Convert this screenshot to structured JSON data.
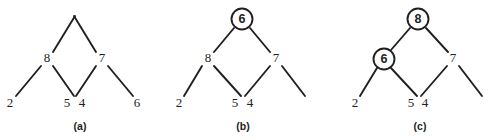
{
  "figure": {
    "width": 496,
    "height": 140,
    "background": "#ffffff",
    "ink_color": "#231f20"
  },
  "panels": [
    {
      "id": "a",
      "caption": "(a)",
      "caption_x": 80,
      "caption_y": 127,
      "nodes": [
        {
          "label": "8",
          "x": 47,
          "y": 59,
          "circled": false
        },
        {
          "label": "7",
          "x": 102,
          "y": 59,
          "circled": false
        },
        {
          "label": "2",
          "x": 10,
          "y": 104,
          "circled": false
        },
        {
          "label": "5",
          "x": 67,
          "y": 104,
          "circled": false
        },
        {
          "label": "4",
          "x": 82,
          "y": 104,
          "circled": false
        },
        {
          "label": "6",
          "x": 137,
          "y": 104,
          "circled": false
        }
      ],
      "edges": [
        {
          "x1": 53,
          "y1": 52,
          "x2": 75,
          "y2": 16
        },
        {
          "x1": 96,
          "y1": 52,
          "x2": 74,
          "y2": 16
        },
        {
          "x1": 41,
          "y1": 66,
          "x2": 16,
          "y2": 96
        },
        {
          "x1": 53,
          "y1": 66,
          "x2": 74,
          "y2": 96
        },
        {
          "x1": 96,
          "y1": 66,
          "x2": 76,
          "y2": 96
        },
        {
          "x1": 108,
          "y1": 66,
          "x2": 133,
          "y2": 96
        }
      ]
    },
    {
      "id": "b",
      "caption": "(b)",
      "caption_x": 243,
      "caption_y": 127,
      "nodes": [
        {
          "label": "6",
          "x": 242,
          "y": 19,
          "circled": true
        },
        {
          "label": "8",
          "x": 208,
          "y": 59,
          "circled": false
        },
        {
          "label": "7",
          "x": 276,
          "y": 59,
          "circled": false
        },
        {
          "label": "2",
          "x": 179,
          "y": 104,
          "circled": false
        },
        {
          "label": "5",
          "x": 235,
          "y": 104,
          "circled": false
        },
        {
          "label": "4",
          "x": 250,
          "y": 104,
          "circled": false
        }
      ],
      "edges": [
        {
          "x1": 234,
          "y1": 28,
          "x2": 214,
          "y2": 52
        },
        {
          "x1": 250,
          "y1": 28,
          "x2": 270,
          "y2": 52
        },
        {
          "x1": 202,
          "y1": 66,
          "x2": 184,
          "y2": 96
        },
        {
          "x1": 214,
          "y1": 66,
          "x2": 241,
          "y2": 96
        },
        {
          "x1": 270,
          "y1": 66,
          "x2": 245,
          "y2": 96
        },
        {
          "x1": 282,
          "y1": 66,
          "x2": 305,
          "y2": 96
        }
      ]
    },
    {
      "id": "c",
      "caption": "(c)",
      "caption_x": 420,
      "caption_y": 127,
      "nodes": [
        {
          "label": "8",
          "x": 418,
          "y": 19,
          "circled": true
        },
        {
          "label": "6",
          "x": 384,
          "y": 59,
          "circled": true
        },
        {
          "label": "7",
          "x": 453,
          "y": 59,
          "circled": false
        },
        {
          "label": "2",
          "x": 355,
          "y": 104,
          "circled": false
        },
        {
          "label": "5",
          "x": 411,
          "y": 104,
          "circled": false
        },
        {
          "label": "4",
          "x": 425,
          "y": 104,
          "circled": false
        }
      ],
      "edges": [
        {
          "x1": 410,
          "y1": 28,
          "x2": 391,
          "y2": 50
        },
        {
          "x1": 426,
          "y1": 28,
          "x2": 448,
          "y2": 52
        },
        {
          "x1": 377,
          "y1": 68,
          "x2": 360,
          "y2": 96
        },
        {
          "x1": 391,
          "y1": 68,
          "x2": 417,
          "y2": 96
        },
        {
          "x1": 447,
          "y1": 66,
          "x2": 421,
          "y2": 96
        },
        {
          "x1": 459,
          "y1": 66,
          "x2": 482,
          "y2": 96
        }
      ]
    }
  ],
  "node_radius": 10.5
}
